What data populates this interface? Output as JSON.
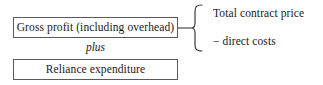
{
  "diagram": {
    "boxes": [
      {
        "id": "gross-profit",
        "label": "Gross profit (including overhead)"
      },
      {
        "id": "reliance",
        "label": "Reliance expenditure"
      }
    ],
    "operator": {
      "label": "plus"
    },
    "brace": {
      "orientation": "left-pointing",
      "color": "#3a3a3a",
      "items": [
        {
          "id": "total-contract-price",
          "label": "Total contract price"
        },
        {
          "id": "direct-costs",
          "label": "− direct costs"
        }
      ]
    },
    "connector": {
      "color": "#3a3a3a"
    }
  }
}
